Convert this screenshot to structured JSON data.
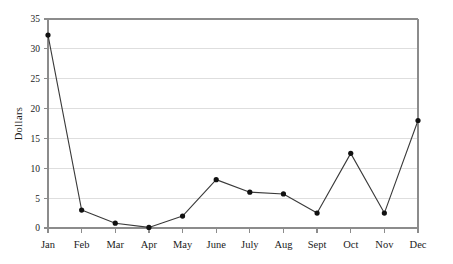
{
  "chart_data": {
    "type": "line",
    "title": "",
    "xlabel": "",
    "ylabel": "Dollars",
    "categories": [
      "Jan",
      "Feb",
      "Mar",
      "Apr",
      "May",
      "June",
      "July",
      "Aug",
      "Sept",
      "Oct",
      "Nov",
      "Dec"
    ],
    "values": [
      32.3,
      3.0,
      0.8,
      0.1,
      2.0,
      8.1,
      6.0,
      5.7,
      2.5,
      12.5,
      2.5,
      18.0
    ],
    "ylim": [
      0,
      35
    ],
    "yticks": [
      0,
      5,
      10,
      15,
      20,
      25,
      30,
      35
    ],
    "ytick_labels": [
      "0",
      "5",
      "10",
      "15",
      "20",
      "25",
      "30",
      "35"
    ],
    "grid": true,
    "grid_axis": "y",
    "legend": null,
    "marker": "filled-circle",
    "series": [
      {
        "name": "Dollars",
        "values": [
          32.3,
          3.0,
          0.8,
          0.1,
          2.0,
          8.1,
          6.0,
          5.7,
          2.5,
          12.5,
          2.5,
          18.0
        ]
      }
    ]
  },
  "style": {
    "line_color": "#3a3a3a",
    "marker_color": "#111111",
    "grid_color": "#dedede",
    "axis_color": "#8c8c8c",
    "background": "#ffffff",
    "text_color": "#1a1a1a"
  },
  "geometry": {
    "plot_left": 48,
    "plot_right": 418,
    "plot_top": 19,
    "plot_bottom": 228
  }
}
